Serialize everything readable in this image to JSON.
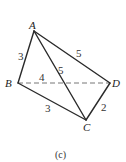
{
  "figure": {
    "caption": "(c)",
    "vertices": {
      "A": {
        "label": "A",
        "x": 34,
        "y": 31
      },
      "B": {
        "label": "B",
        "x": 18,
        "y": 83
      },
      "C": {
        "label": "C",
        "x": 86,
        "y": 120
      },
      "D": {
        "label": "D",
        "x": 110,
        "y": 83
      }
    },
    "edges": {
      "AB": {
        "length": "3",
        "style": "solid"
      },
      "AD": {
        "length": "5",
        "style": "solid"
      },
      "AC": {
        "length": "5",
        "style": "solid"
      },
      "BD": {
        "length": "4",
        "style": "dashed"
      },
      "BC": {
        "length": "3",
        "style": "solid"
      },
      "CD": {
        "length": "2",
        "style": "solid"
      }
    }
  }
}
